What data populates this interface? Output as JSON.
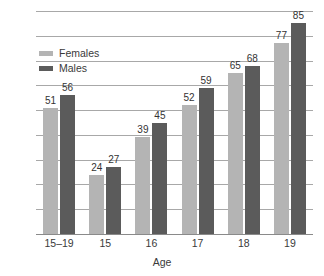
{
  "chart_data": {
    "type": "bar",
    "title": "",
    "xlabel": "Age",
    "ylabel": "",
    "categories": [
      "15–19",
      "15",
      "16",
      "17",
      "18",
      "19"
    ],
    "series": [
      {
        "name": "Females",
        "color": "#b4b4b4",
        "values": [
          51,
          24,
          39,
          52,
          65,
          77
        ]
      },
      {
        "name": "Males",
        "color": "#5b5b5b",
        "values": [
          56,
          27,
          45,
          59,
          68,
          85
        ]
      }
    ],
    "ylim": [
      0,
      90
    ],
    "ytick_labels": [
      "0",
      "10",
      "20",
      "30",
      "40",
      "50",
      "60",
      "70",
      "80",
      "90"
    ],
    "ytick_values": [
      0,
      10,
      20,
      30,
      40,
      50,
      60,
      70,
      80,
      90
    ],
    "grid": true,
    "legend_position": "top-left",
    "data_labels": true
  }
}
